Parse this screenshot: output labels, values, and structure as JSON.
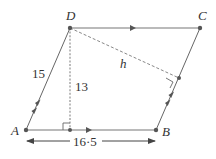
{
  "diagram": {
    "type": "parallelogram",
    "colors": {
      "edge": "#6d6d6d",
      "dashed": "#8a8a8a",
      "point": "#555555",
      "text": "#333333"
    },
    "points": {
      "A": {
        "label": "A",
        "x": 26,
        "y": 130
      },
      "B": {
        "label": "B",
        "x": 156,
        "y": 130
      },
      "C": {
        "label": "C",
        "x": 200,
        "y": 28
      },
      "D": {
        "label": "D",
        "x": 70,
        "y": 28
      },
      "foot_AB": {
        "x": 70,
        "y": 130
      },
      "foot_BC": {
        "x": 179,
        "y": 78
      }
    },
    "labels": {
      "side_AD": "15",
      "height_to_AB": "13",
      "base_AB": "16·5",
      "height_to_BC": "h"
    },
    "annotations": {
      "parallel_AB_DC": "single arrow",
      "parallel_AD_BC": "double arrow",
      "right_angle_at_foot_AB": true,
      "right_angle_at_foot_BC": true,
      "dimension_line": "double-headed arrow below AB"
    }
  }
}
